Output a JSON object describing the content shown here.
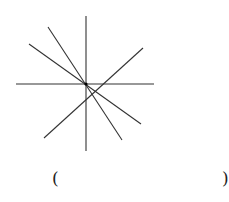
{
  "diagram": {
    "type": "lines-through-point",
    "center": [
      86,
      84
    ],
    "line_color": "#333333",
    "line_count": 5,
    "segments": [
      {
        "from": [
          86,
          16
        ],
        "to": [
          86,
          151
        ]
      },
      {
        "from": [
          16,
          84
        ],
        "to": [
          154,
          84
        ]
      },
      {
        "from": [
          29,
          44
        ],
        "to": [
          141,
          124
        ]
      },
      {
        "from": [
          48,
          27
        ],
        "to": [
          122,
          140
        ]
      },
      {
        "from": [
          143,
          48
        ],
        "to": [
          44,
          138
        ]
      }
    ]
  },
  "answer": {
    "open_paren": "(",
    "close_paren": ")"
  }
}
